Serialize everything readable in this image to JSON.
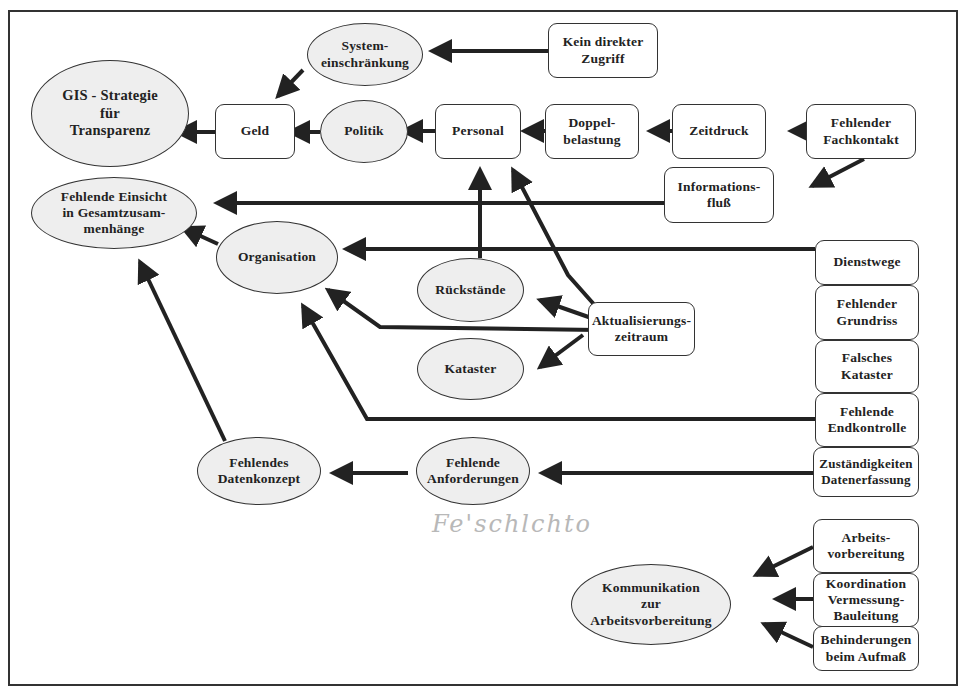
{
  "diagram": {
    "colors": {
      "line": "#222222",
      "ellipse_fill": "#eeeeee",
      "box_fill": "#ffffff",
      "frame": "#333333",
      "handwriting": "#b8b8b8"
    },
    "nodes": {
      "gis_strategie": "GIS - Strategie\nfür\nTransparenz",
      "systemeinschraenkung": "System-\neinschränkung",
      "kein_direkter_zugriff": "Kein direkter\nZugriff",
      "geld": "Geld",
      "politik": "Politik",
      "personal": "Personal",
      "doppelbelastung": "Doppel-\nbelastung",
      "zeitdruck": "Zeitdruck",
      "fehlender_fachkontakt": "Fehlender\nFachkontakt",
      "informationsfluss": "Informations-\nfluß",
      "fehlende_einsicht": "Fehlende Einsicht\nin Gesamtzusam-\nmenhänge",
      "organisation": "Organisation",
      "rueckstaende": "Rückstände",
      "kataster": "Kataster",
      "aktualisierungszeitraum": "Aktualisierungs-\nzeitraum",
      "dienstwege": "Dienstwege",
      "fehlender_grundriss": "Fehlender\nGrundriss",
      "falsches_kataster": "Falsches\nKataster",
      "fehlende_endkontrolle": "Fehlende\nEndkontrolle",
      "zustaendigkeiten": "Zuständigkeiten\nDatenerfassung",
      "fehlende_anforderungen": "Fehlende\nAnforderungen",
      "fehlendes_datenkonzept": "Fehlendes\nDatenkonzept",
      "kommunikation": "Kommunikation\nzur\nArbeitsvorbereitung",
      "arbeitsvorbereitung": "Arbeits-\nvorbereitung",
      "koordination": "Koordination\nVermessung-\nBauleitung",
      "behinderungen": "Behinderungen\nbeim Aufmaß"
    },
    "handwritten_note": "Fe'schlchto",
    "edges": [
      {
        "from": "Kein direkter Zugriff",
        "to": "System-einschränkung"
      },
      {
        "from": "System-einschränkung",
        "to": "Geld"
      },
      {
        "from": "Geld",
        "to": "GIS - Strategie für Transparenz"
      },
      {
        "from": "Politik",
        "to": "Geld"
      },
      {
        "from": "Personal",
        "to": "Politik"
      },
      {
        "from": "Doppelbelastung",
        "to": "Personal"
      },
      {
        "from": "Zeitdruck",
        "to": "Doppelbelastung"
      },
      {
        "from": "Fehlender Fachkontakt",
        "to": "Zeitdruck"
      },
      {
        "from": "Fehlender Fachkontakt",
        "to": "Informationsfluß"
      },
      {
        "from": "Informationsfluß",
        "to": "Fehlende Einsicht in Gesamtzusammenhänge"
      },
      {
        "from": "Organisation",
        "to": "Fehlende Einsicht in Gesamtzusammenhänge"
      },
      {
        "from": "Dienstwege",
        "to": "Organisation"
      },
      {
        "from": "Rückstände",
        "to": "Personal"
      },
      {
        "from": "Aktualisierungszeitraum",
        "to": "Personal"
      },
      {
        "from": "Aktualisierungszeitraum",
        "to": "Rückstände"
      },
      {
        "from": "Aktualisierungszeitraum",
        "to": "Kataster"
      },
      {
        "from": "Aktualisierungszeitraum",
        "to": "Organisation"
      },
      {
        "from": "Fehlende Endkontrolle",
        "to": "Organisation"
      },
      {
        "from": "Zuständigkeiten Datenerfassung",
        "to": "Fehlende Anforderungen"
      },
      {
        "from": "Fehlende Anforderungen",
        "to": "Fehlendes Datenkonzept"
      },
      {
        "from": "Fehlendes Datenkonzept",
        "to": "Fehlende Einsicht in Gesamtzusammenhänge"
      },
      {
        "from": "Arbeitsvorbereitung",
        "to": "Kommunikation zur Arbeitsvorbereitung"
      },
      {
        "from": "Koordination Vermessung-Bauleitung",
        "to": "Kommunikation zur Arbeitsvorbereitung"
      },
      {
        "from": "Behinderungen beim Aufmaß",
        "to": "Kommunikation zur Arbeitsvorbereitung"
      }
    ]
  }
}
